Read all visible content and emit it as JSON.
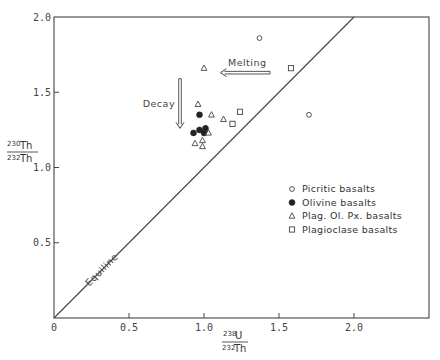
{
  "chart_data": {
    "type": "scatter",
    "title": "",
    "xlabel": "238U / 232Th",
    "ylabel": "230Th / 232Th",
    "xlabel_parts": {
      "numerator": "238U",
      "numerator_sup": "238",
      "numerator_base": "U",
      "denominator_sup": "232",
      "denominator_base": "Th"
    },
    "ylabel_parts": {
      "numerator_sup": "230",
      "numerator_base": "Th",
      "denominator_sup": "232",
      "denominator_base": "Th"
    },
    "xlim": [
      0,
      2.5
    ],
    "ylim": [
      0,
      2.0
    ],
    "x_ticks": [
      {
        "value": 0,
        "label": "0"
      },
      {
        "value": 0.5,
        "label": "0.5"
      },
      {
        "value": 1.0,
        "label": "1.0"
      },
      {
        "value": 1.5,
        "label": "1.5"
      },
      {
        "value": 2.0,
        "label": "2.0"
      }
    ],
    "y_ticks": [
      {
        "value": 0.5,
        "label": "0.5"
      },
      {
        "value": 1.0,
        "label": "1.0"
      },
      {
        "value": 1.5,
        "label": "1.5"
      },
      {
        "value": 2.0,
        "label": "2.0"
      }
    ],
    "grid": false,
    "legend_position": "right-middle",
    "series": [
      {
        "name": "Picritic basalts",
        "marker": "open-circle",
        "points": [
          [
            1.37,
            1.86
          ],
          [
            1.7,
            1.35
          ]
        ]
      },
      {
        "name": "Olivine basalts",
        "marker": "filled-circle",
        "points": [
          [
            0.97,
            1.35
          ],
          [
            0.93,
            1.23
          ],
          [
            0.97,
            1.25
          ],
          [
            1.01,
            1.26
          ],
          [
            1.0,
            1.23
          ]
        ]
      },
      {
        "name": "Plag. Ol. Px. basalts",
        "marker": "open-triangle",
        "points": [
          [
            1.0,
            1.66
          ],
          [
            0.96,
            1.42
          ],
          [
            1.05,
            1.35
          ],
          [
            1.13,
            1.32
          ],
          [
            1.03,
            1.23
          ],
          [
            0.99,
            1.18
          ],
          [
            0.94,
            1.16
          ],
          [
            0.99,
            1.14
          ]
        ]
      },
      {
        "name": "Plagioclase basalts",
        "marker": "open-square",
        "points": [
          [
            1.58,
            1.66
          ],
          [
            1.24,
            1.37
          ],
          [
            1.19,
            1.29
          ]
        ]
      }
    ],
    "reference_lines": [
      {
        "name": "Equiline",
        "label": "Equiline",
        "from": [
          0,
          0
        ],
        "to": [
          2.0,
          2.0
        ]
      }
    ],
    "annotations": [
      {
        "text": "Melting",
        "arrow": "left",
        "from": [
          1.44,
          1.63
        ],
        "to": [
          1.11,
          1.63
        ]
      },
      {
        "text": "Decay",
        "arrow": "down",
        "from": [
          0.84,
          1.59
        ],
        "to": [
          0.84,
          1.26
        ]
      }
    ]
  },
  "labels": {
    "equiline": "Equiline",
    "melting": "Melting",
    "decay": "Decay"
  },
  "legend": [
    {
      "label": "Picritic basalts",
      "marker": "open-circle"
    },
    {
      "label": "Olivine basalts",
      "marker": "filled-circle"
    },
    {
      "label": "Plag. Ol. Px. basalts",
      "marker": "open-triangle"
    },
    {
      "label": "Plagioclase basalts",
      "marker": "open-square"
    }
  ],
  "axes": {
    "x_label_num_sup": "238",
    "x_label_num_base": "U",
    "x_label_den_sup": "232",
    "x_label_den_base": "Th",
    "y_label_num_sup": "230",
    "y_label_num_base": "Th",
    "y_label_den_sup": "232",
    "y_label_den_base": "Th"
  },
  "colors": {
    "ink": "#444444",
    "background": "#ffffff"
  }
}
